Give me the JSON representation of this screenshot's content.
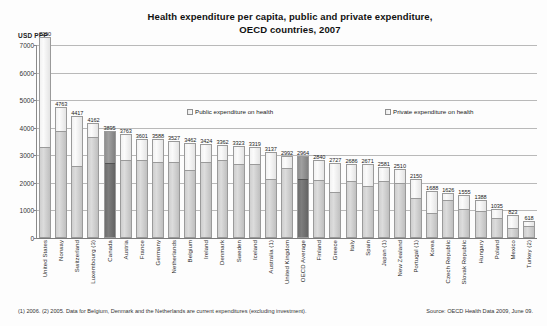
{
  "chart_data": {
    "type": "bar",
    "title": "Health expenditure per capita, public and private expenditure, OECD countries, 2007",
    "title_line1": "Health expenditure per capita, public and private expenditure,",
    "title_line2": "OECD countries, 2007",
    "ylabel": "USD PPP",
    "xlabel": "",
    "ylim": [
      0,
      7000
    ],
    "yticks": [
      0,
      1000,
      2000,
      3000,
      4000,
      5000,
      6000,
      7000
    ],
    "ytick_labels": [
      "0",
      "1000",
      "2000",
      "3000",
      "4000",
      "5000",
      "6000",
      "7000"
    ],
    "grid": true,
    "stacked": true,
    "legend_position": "inside-top",
    "legend": [
      {
        "label": "Public expenditure on health",
        "color": "#cfcfcf"
      },
      {
        "label": "Private expenditure on health",
        "color": "#f2f2f2"
      }
    ],
    "categories": [
      "United States",
      "Norway",
      "Switzerland",
      "Luxembourg (3)",
      "Canada",
      "Austria",
      "France",
      "Germany",
      "Netherlands",
      "Belgium",
      "Ireland",
      "Denmark",
      "Sweden",
      "Iceland",
      "Australia (1)",
      "United Kingdom",
      "OECD Average",
      "Finland",
      "Greece",
      "Italy",
      "Spain",
      "Japan (1)",
      "New Zealand",
      "Portugal (1)",
      "Korea",
      "Czech Republic",
      "Slovak Republic",
      "Hungary",
      "Poland",
      "Mexico",
      "Turkey (2)"
    ],
    "values": [
      7290,
      4763,
      4417,
      4162,
      3895,
      3763,
      3601,
      3588,
      3527,
      3462,
      3424,
      3362,
      3323,
      3319,
      3137,
      2992,
      2964,
      2840,
      2727,
      2686,
      2671,
      2581,
      2510,
      2150,
      1688,
      1626,
      1555,
      1388,
      1035,
      823,
      618
    ],
    "series": [
      {
        "name": "Public expenditure on health",
        "values": [
          3307,
          3919,
          2603,
          3706,
          2720,
          2855,
          2844,
          2758,
          2766,
          2481,
          2765,
          2847,
          2720,
          2713,
          2137,
          2560,
          2170,
          2131,
          1669,
          2091,
          1920,
          2097,
          2022,
          1475,
          927,
          1413,
          1063,
          1000,
          732,
          368,
          444
        ]
      },
      {
        "name": "Private expenditure on health",
        "values": [
          3983,
          844,
          1814,
          456,
          1175,
          908,
          757,
          830,
          761,
          981,
          659,
          515,
          603,
          606,
          1000,
          432,
          794,
          709,
          1058,
          595,
          751,
          484,
          488,
          675,
          761,
          213,
          492,
          388,
          303,
          455,
          174
        ]
      }
    ],
    "highlighted_bars": [
      "Canada",
      "OECD Average"
    ],
    "value_labels": [
      "7290",
      "4763",
      "4417",
      "4162",
      "3895",
      "3763",
      "3601",
      "3588",
      "3527",
      "3462",
      "3424",
      "3362",
      "3323",
      "3319",
      "3137",
      "2992",
      "2964",
      "2840",
      "2727",
      "2686",
      "2671",
      "2581",
      "2510",
      "2150",
      "1688",
      "1626",
      "1555",
      "1388",
      "1035",
      "823",
      "618"
    ]
  },
  "footnote": {
    "notes": "(1) 2006.  (2) 2005.  Data for Belgium, Denmark and the Netherlands are current expenditures (excluding investment).",
    "source": "Source: OECD Health Data 2009, June 09."
  }
}
